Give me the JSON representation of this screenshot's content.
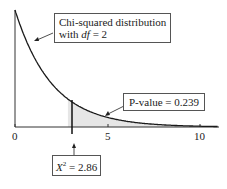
{
  "chart_data": {
    "type": "line",
    "title": "",
    "xlabel": "",
    "ylabel": "",
    "xlim": [
      0,
      11
    ],
    "xticks": [
      "0",
      "5",
      "10"
    ],
    "series": [
      {
        "name": "Chi-squared density df=2",
        "function": "0.5*exp(-x/2)",
        "x": [
          0,
          1,
          2,
          2.86,
          3,
          4,
          5,
          6,
          7,
          8,
          9,
          10
        ],
        "values": [
          0.5,
          0.303,
          0.184,
          0.12,
          0.112,
          0.068,
          0.041,
          0.025,
          0.015,
          0.009,
          0.006,
          0.003
        ]
      }
    ],
    "shaded_region": {
      "from": 2.86,
      "to": 11,
      "area": 0.239
    },
    "annotations": [
      "Chi-squared distribution with df = 2",
      "P-value = 0.239",
      "X² = 2.86"
    ],
    "grid": false
  },
  "labels": {
    "curve_line1": "Chi-squared distribution",
    "curve_line2_prefix": "with ",
    "curve_df": "df",
    "curve_line2_suffix": " = 2",
    "pvalue": "P-value = 0.239",
    "stat_symbol": "X",
    "stat_sup": "2",
    "stat_value": " = 2.86",
    "tick0": "0",
    "tick5": "5",
    "tick10": "10"
  },
  "colors": {
    "curve": "#1a1a1a",
    "shade": "#e6e6e6",
    "axis": "#333333"
  }
}
